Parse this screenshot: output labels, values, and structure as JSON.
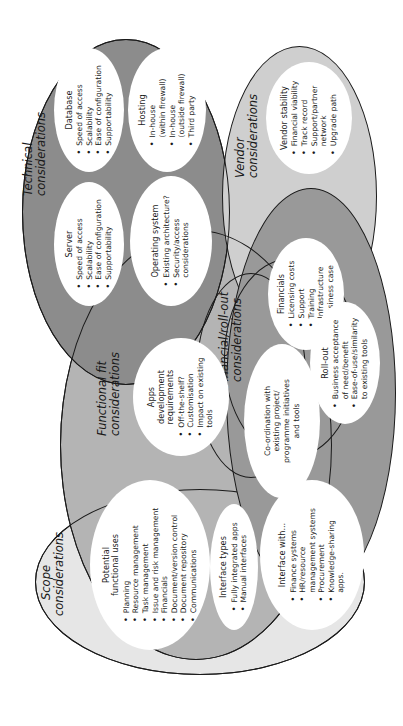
{
  "diagram": {
    "orientation": "rotated 90° counter-clockwise",
    "colors": {
      "technical": "#8c8c8c",
      "vendor": "#cfcfcf",
      "financial": "#999999",
      "functional": "#b4b4b4",
      "scope": "#e6e6e6",
      "bubble": "#ffffff",
      "outline": "#1a1a1a"
    },
    "groups": {
      "technical": {
        "label_line1": "Technical",
        "label_line2": "considerations",
        "bubbles": {
          "database": {
            "title": "Database",
            "items": [
              "Speed of access",
              "Scalability",
              "Ease of configuration",
              "Supportability"
            ]
          },
          "hosting": {
            "title": "Hosting",
            "items": [
              "In-house (within firewall)",
              "In-house (outside firewall)",
              "Third party"
            ],
            "items_lines": [
              [
                "In-house",
                "(within firewall)"
              ],
              [
                "In-house",
                "(outside firewall)"
              ],
              [
                "Third party"
              ]
            ]
          },
          "server": {
            "title": "Server",
            "items": [
              "Speed of access",
              "Scalability",
              "Ease of configuration",
              "Supportability"
            ]
          },
          "operating_system": {
            "title": "Operating system",
            "items": [
              "Existing architecture?",
              "Security/access considerations"
            ],
            "items_lines": [
              [
                "Existing architecture?"
              ],
              [
                "Security/access",
                "considerations"
              ]
            ]
          }
        }
      },
      "vendor": {
        "label_line1": "Vendor",
        "label_line2": "considerations",
        "bubbles": {
          "vendor_stability": {
            "title": "Vendor stability",
            "items": [
              "Financial viability",
              "Track record",
              "Support/partner network",
              "Upgrade path"
            ],
            "items_lines": [
              [
                "Financial viability"
              ],
              [
                "Track record"
              ],
              [
                "Support/partner",
                "network"
              ],
              [
                "Upgrade path"
              ]
            ]
          }
        }
      },
      "financial": {
        "label_line1": "Financial/roll-out",
        "label_line2": "considerations",
        "bubbles": {
          "financials": {
            "title": "Financials",
            "items": [
              "Licensing costs",
              "Support",
              "Training",
              "Infrastructure",
              "Business case"
            ]
          },
          "roll_out": {
            "title": "Roll-out",
            "items": [
              "Business acceptance of need/benefit",
              "Ease-of-use/similarity to existing tools"
            ],
            "items_lines": [
              [
                "Business acceptance",
                "of need/benefit"
              ],
              [
                "Ease-of-use/similarity",
                "to existing tools"
              ]
            ]
          },
          "coordination": {
            "title_lines": [
              "Co-ordination with",
              "existing project/",
              "programme initiatives",
              "and tools"
            ]
          }
        }
      },
      "functional": {
        "label_line1": "Functional fit",
        "label_line2": "considerations",
        "bubbles": {
          "apps_dev": {
            "title_lines": [
              "Apps",
              "development",
              "requirements"
            ],
            "items": [
              "Off-the-shelf?",
              "Customisation",
              "Impact on existing tools"
            ],
            "items_lines": [
              [
                "Off-the-shelf?"
              ],
              [
                "Customisation"
              ],
              [
                "Impact on existing",
                "tools"
              ]
            ]
          }
        }
      },
      "scope": {
        "label_line1": "Scope",
        "label_line2": "considerations",
        "bubbles": {
          "potential_uses": {
            "title_lines": [
              "Potential",
              "functional uses"
            ],
            "items": [
              "Planning",
              "Resource management",
              "Task management",
              "Issue and risk management",
              "Financials",
              "Document/version control",
              "Document repository",
              "Communications"
            ]
          },
          "interface_types": {
            "title": "Interface types",
            "items": [
              "Fully integrated apps",
              "Manual interfaces"
            ]
          },
          "interface_with": {
            "title": "Interface with...",
            "items": [
              "Finance systems",
              "HR/resource management systems",
              "Procurement",
              "Knowledge-sharing apps."
            ],
            "items_lines": [
              [
                "Finance systems"
              ],
              [
                "HR/resource",
                "management systems"
              ],
              [
                "Procurement"
              ],
              [
                "Knowledge-sharing",
                "apps."
              ]
            ]
          }
        }
      }
    }
  }
}
